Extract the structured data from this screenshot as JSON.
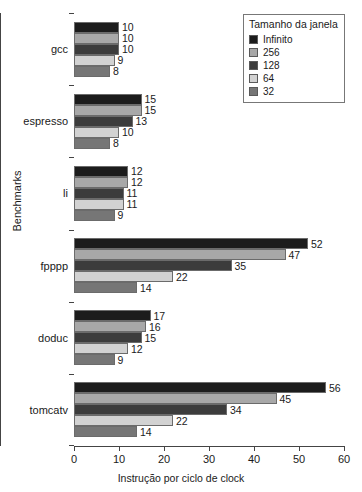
{
  "chart_data": {
    "type": "bar",
    "orientation": "horizontal",
    "title": "",
    "xlabel": "Instrução por ciclo de clock",
    "ylabel": "Benchmarks",
    "xlim": [
      0,
      60
    ],
    "xticks": [
      0,
      10,
      20,
      30,
      40,
      50,
      60
    ],
    "grid": false,
    "legend_position": "top-right",
    "legend_title": "Tamanho da janela",
    "categories": [
      "gcc",
      "espresso",
      "li",
      "fpppp",
      "doduc",
      "tomcatv"
    ],
    "series": [
      {
        "name": "Infinito",
        "color": "#1c1c1c",
        "values": [
          10,
          15,
          12,
          52,
          17,
          56
        ]
      },
      {
        "name": "256",
        "color": "#a8a8a8",
        "values": [
          10,
          15,
          12,
          47,
          16,
          45
        ]
      },
      {
        "name": "128",
        "color": "#3c3c3c",
        "values": [
          10,
          13,
          11,
          35,
          15,
          34
        ]
      },
      {
        "name": "64",
        "color": "#d2d2d2",
        "values": [
          9,
          10,
          11,
          22,
          12,
          22
        ]
      },
      {
        "name": "32",
        "color": "#767676",
        "values": [
          8,
          8,
          9,
          14,
          9,
          14
        ]
      }
    ]
  },
  "legend": {
    "title": "Tamanho da janela",
    "items": [
      {
        "label": "Infinito",
        "color": "#1c1c1c"
      },
      {
        "label": "256",
        "color": "#a8a8a8"
      },
      {
        "label": "128",
        "color": "#3c3c3c"
      },
      {
        "label": "64",
        "color": "#d2d2d2"
      },
      {
        "label": "32",
        "color": "#767676"
      }
    ]
  },
  "axes": {
    "x_title": "Instrução por ciclo de clock",
    "y_title": "Benchmarks",
    "x_tick_labels": [
      "0",
      "10",
      "20",
      "30",
      "40",
      "50",
      "60"
    ]
  }
}
